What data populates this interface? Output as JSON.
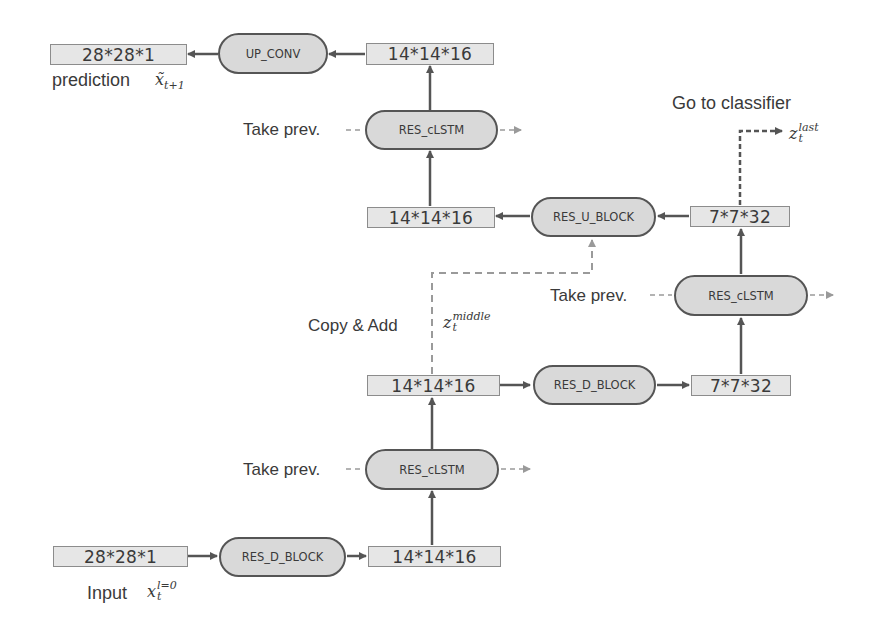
{
  "diagram": {
    "colors": {
      "tensor_fill": "#e6e6e6",
      "block_fill": "#d9d9d9",
      "arrow": "#555555",
      "dashed": "#7f7f7f",
      "text": "#3a3a3a"
    },
    "tensors": {
      "pred_out": "28*28*1",
      "top_in": "14*14*16",
      "mid_up": "14*14*16",
      "top_right": "7*7*32",
      "mid_left": "14*14*16",
      "mid_right": "7*7*32",
      "input": "28*28*1",
      "bottom_right": "14*14*16"
    },
    "blocks": {
      "up_conv": "UP_CONV",
      "lstm_top": "RES_cLSTM",
      "u_block": "RES_U_BLOCK",
      "lstm_right": "RES_cLSTM",
      "d_block_mid": "RES_D_BLOCK",
      "lstm_bottom": "RES_cLSTM",
      "d_block_bottom": "RES_D_BLOCK"
    },
    "labels": {
      "prediction": "prediction",
      "prediction_var": "x̃",
      "prediction_sub": "t+1",
      "take_prev_top": "Take prev.",
      "go_to_classifier": "Go to classifier",
      "z_last_var": "z",
      "z_last_sup": "last",
      "z_last_sub": "t",
      "take_prev_right": "Take prev.",
      "copy_add": "Copy & Add",
      "z_middle_var": "z",
      "z_middle_sup": "middle",
      "z_middle_sub": "t",
      "take_prev_bottom": "Take prev.",
      "input": "Input",
      "input_var": "x",
      "input_sup": "l=0",
      "input_sub": "t"
    }
  }
}
